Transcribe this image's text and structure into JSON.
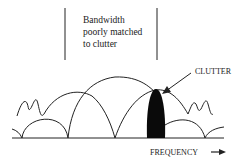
{
  "annotation": {
    "lines": [
      "Bandwidth",
      "poorly matched",
      "to clutter"
    ]
  },
  "clutter_label": "CLUTTER",
  "axis_label": "FREQUENCY",
  "colors": {
    "ink": "#222222",
    "clutter_fill": "#0a0a0a",
    "background": "#ffffff"
  }
}
